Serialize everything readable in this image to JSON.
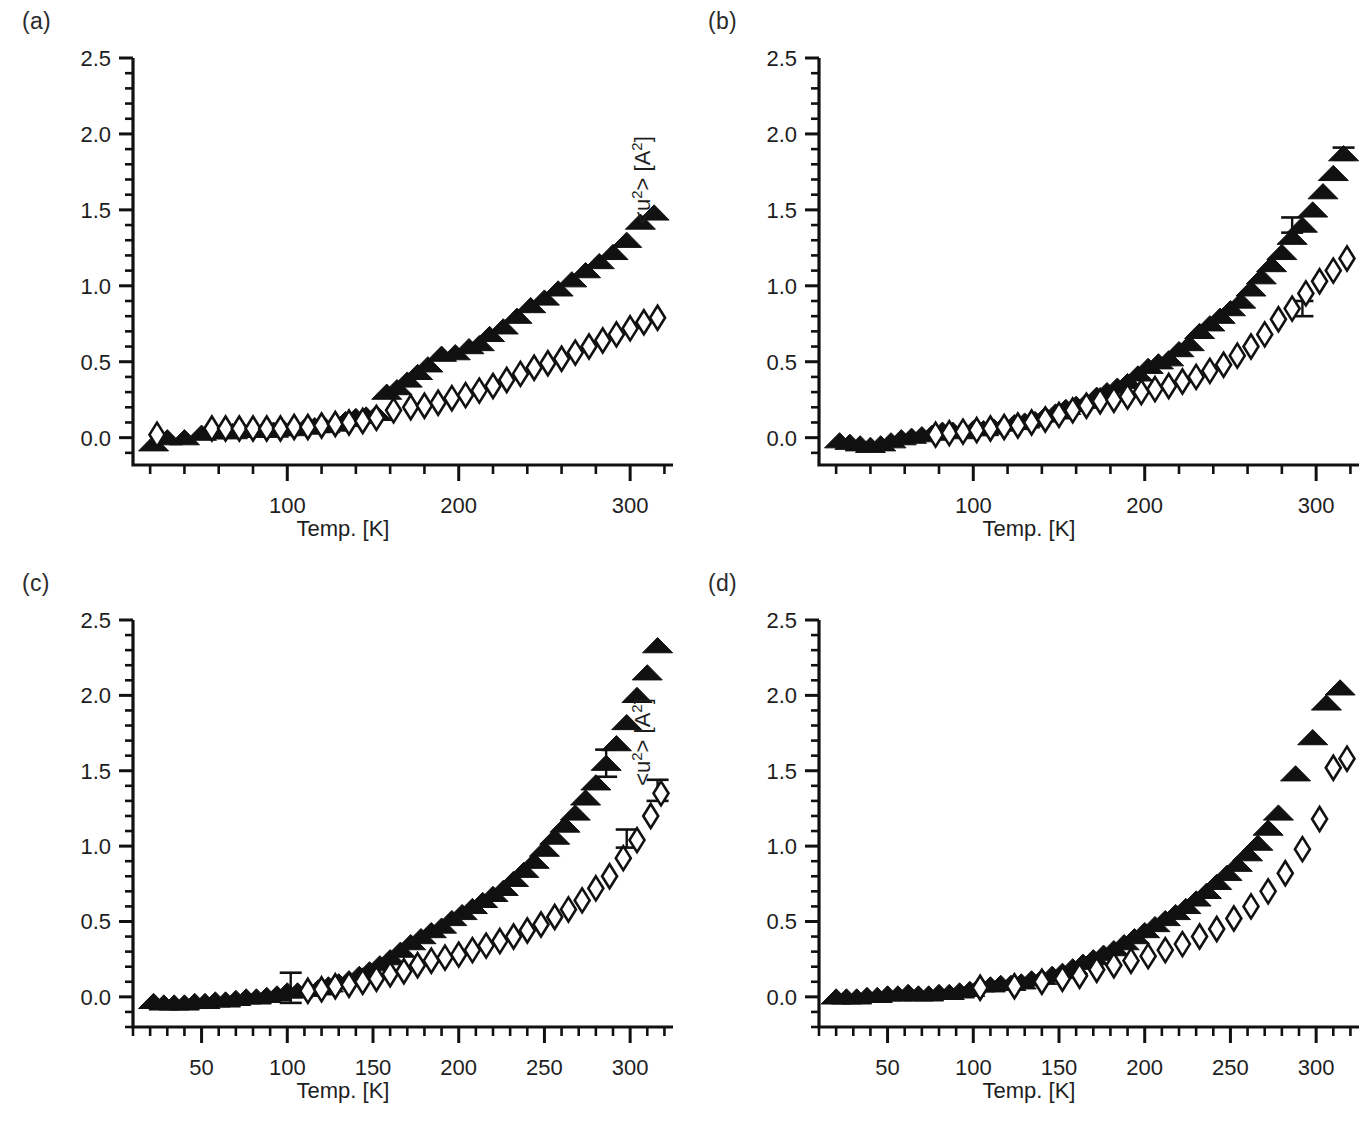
{
  "figure": {
    "background": "#ffffff",
    "panel_count": 4,
    "marker_color": "#111111"
  },
  "panels": [
    {
      "label": "(a)",
      "xlabel": "Temp. [K]",
      "ylabel_prefix": "<u",
      "ylabel_sup1": "2",
      "ylabel_mid": "> [A",
      "ylabel_sup2": "2",
      "ylabel_suffix": "]"
    },
    {
      "label": "(b)",
      "xlabel": "Temp. [K]",
      "ylabel_prefix": "<u",
      "ylabel_sup1": "2",
      "ylabel_mid": "> [A",
      "ylabel_sup2": "2",
      "ylabel_suffix": "]"
    },
    {
      "label": "(c)",
      "xlabel": "Temp. [K]",
      "ylabel_prefix": "<u",
      "ylabel_sup1": "2",
      "ylabel_mid": "> [A",
      "ylabel_sup2": "2",
      "ylabel_suffix": "]"
    },
    {
      "label": "(d)",
      "xlabel": "Temp. [K]",
      "ylabel_prefix": "<u",
      "ylabel_sup1": "2",
      "ylabel_mid": "> [A",
      "ylabel_sup2": "2",
      "ylabel_suffix": "]"
    }
  ],
  "chart_data": [
    {
      "panel": "(a)",
      "type": "scatter",
      "title": "",
      "xlabel": "Temp. [K]",
      "ylabel": "<u2> [A2]",
      "xlim": [
        10,
        325
      ],
      "ylim": [
        -0.18,
        2.5
      ],
      "xticks": [
        100,
        200,
        300
      ],
      "xtick_labels": [
        "100",
        "200",
        "300"
      ],
      "xminor_step": 20,
      "yticks": [
        0.0,
        0.5,
        1.0,
        1.5,
        2.0,
        2.5
      ],
      "ytick_labels": [
        "0.0",
        "0.5",
        "1.0",
        "1.5",
        "2.0",
        "2.5"
      ],
      "yminor_step": 0.1,
      "grid": false,
      "legend": "none",
      "series": [
        {
          "name": "filled-triangle",
          "marker": "triangle",
          "fill": "solid",
          "x": [
            22,
            30,
            40,
            50,
            56,
            62,
            68,
            74,
            80,
            86,
            92,
            98,
            104,
            110,
            116,
            122,
            128,
            134,
            140,
            146,
            152,
            158,
            164,
            170,
            176,
            182,
            190,
            198,
            206,
            212,
            218,
            226,
            234,
            242,
            250,
            258,
            266,
            274,
            282,
            290,
            298,
            306,
            314
          ],
          "y": [
            -0.04,
            0.0,
            0.0,
            0.03,
            0.04,
            0.04,
            0.04,
            0.05,
            0.05,
            0.05,
            0.05,
            0.06,
            0.06,
            0.07,
            0.08,
            0.08,
            0.09,
            0.12,
            0.14,
            0.15,
            0.16,
            0.3,
            0.33,
            0.38,
            0.43,
            0.48,
            0.55,
            0.56,
            0.6,
            0.62,
            0.68,
            0.73,
            0.8,
            0.87,
            0.92,
            0.98,
            1.04,
            1.1,
            1.16,
            1.22,
            1.3,
            1.42,
            1.48,
            1.55
          ]
        },
        {
          "name": "open-diamond",
          "marker": "diamond",
          "fill": "open",
          "x": [
            24,
            56,
            64,
            72,
            80,
            88,
            96,
            104,
            112,
            120,
            128,
            136,
            144,
            152,
            162,
            172,
            180,
            188,
            196,
            204,
            212,
            220,
            228,
            236,
            244,
            252,
            260,
            268,
            276,
            284,
            292,
            300,
            308,
            316
          ],
          "y": [
            0.02,
            0.06,
            0.06,
            0.06,
            0.06,
            0.06,
            0.06,
            0.07,
            0.07,
            0.08,
            0.09,
            0.1,
            0.11,
            0.13,
            0.18,
            0.2,
            0.21,
            0.23,
            0.26,
            0.28,
            0.31,
            0.34,
            0.38,
            0.42,
            0.46,
            0.49,
            0.52,
            0.56,
            0.6,
            0.64,
            0.68,
            0.72,
            0.76,
            0.79
          ]
        }
      ],
      "errorbars": []
    },
    {
      "panel": "(b)",
      "type": "scatter",
      "title": "",
      "xlabel": "Temp. [K]",
      "ylabel": "<u2> [A2]",
      "xlim": [
        10,
        325
      ],
      "ylim": [
        -0.18,
        2.5
      ],
      "xticks": [
        100,
        200,
        300
      ],
      "xtick_labels": [
        "100",
        "200",
        "300"
      ],
      "xminor_step": 20,
      "yticks": [
        0.0,
        0.5,
        1.0,
        1.5,
        2.0,
        2.5
      ],
      "ytick_labels": [
        "0.0",
        "0.5",
        "1.0",
        "1.5",
        "2.0",
        "2.5"
      ],
      "yminor_step": 0.1,
      "grid": false,
      "legend": "none",
      "series": [
        {
          "name": "filled-triangle",
          "marker": "triangle",
          "fill": "solid",
          "x": [
            22,
            28,
            34,
            40,
            46,
            52,
            58,
            64,
            70,
            76,
            82,
            88,
            94,
            100,
            106,
            112,
            118,
            124,
            130,
            136,
            142,
            148,
            154,
            160,
            166,
            172,
            178,
            184,
            190,
            196,
            202,
            208,
            214,
            220,
            226,
            232,
            238,
            244,
            250,
            256,
            262,
            268,
            274,
            280,
            286,
            292,
            298,
            304,
            310,
            316
          ],
          "y": [
            -0.02,
            -0.03,
            -0.04,
            -0.05,
            -0.04,
            -0.02,
            0.0,
            0.01,
            0.02,
            0.03,
            0.05,
            0.05,
            0.04,
            0.06,
            0.06,
            0.07,
            0.09,
            0.1,
            0.11,
            0.12,
            0.15,
            0.17,
            0.2,
            0.22,
            0.24,
            0.28,
            0.31,
            0.34,
            0.37,
            0.42,
            0.47,
            0.5,
            0.52,
            0.58,
            0.62,
            0.7,
            0.75,
            0.8,
            0.85,
            0.9,
            0.98,
            1.06,
            1.14,
            1.22,
            1.32,
            1.4,
            1.5,
            1.62,
            1.74,
            1.87
          ]
        },
        {
          "name": "open-diamond",
          "marker": "diamond",
          "fill": "open",
          "x": [
            78,
            86,
            94,
            102,
            110,
            118,
            126,
            134,
            142,
            150,
            158,
            166,
            174,
            182,
            190,
            198,
            206,
            214,
            222,
            230,
            238,
            246,
            254,
            262,
            270,
            278,
            286,
            294,
            302,
            310,
            318
          ],
          "y": [
            0.02,
            0.03,
            0.04,
            0.05,
            0.06,
            0.07,
            0.08,
            0.1,
            0.12,
            0.15,
            0.18,
            0.21,
            0.24,
            0.25,
            0.27,
            0.3,
            0.32,
            0.34,
            0.37,
            0.4,
            0.44,
            0.48,
            0.54,
            0.6,
            0.68,
            0.78,
            0.85,
            0.95,
            1.03,
            1.1,
            1.18
          ]
        }
      ],
      "errorbars": [
        {
          "x": 286,
          "y": 1.4,
          "yerr": 0.05
        },
        {
          "x": 316,
          "y": 1.87,
          "yerr": 0.04
        },
        {
          "x": 292,
          "y": 0.85,
          "yerr": 0.05
        }
      ]
    },
    {
      "panel": "(c)",
      "type": "scatter",
      "title": "",
      "xlabel": "Temp. [K]",
      "ylabel": "<u2> [A2]",
      "xlim": [
        10,
        325
      ],
      "ylim": [
        -0.2,
        2.5
      ],
      "xticks": [
        50,
        100,
        150,
        200,
        250,
        300
      ],
      "xtick_labels": [
        "50",
        "100",
        "150",
        "200",
        "250",
        "300"
      ],
      "xminor_step": 10,
      "yticks": [
        0.0,
        0.5,
        1.0,
        1.5,
        2.0,
        2.5
      ],
      "ytick_labels": [
        "0.0",
        "0.5",
        "1.0",
        "1.5",
        "2.0",
        "2.5"
      ],
      "yminor_step": 0.1,
      "grid": false,
      "legend": "none",
      "series": [
        {
          "name": "filled-triangle",
          "marker": "triangle",
          "fill": "solid",
          "x": [
            22,
            28,
            34,
            40,
            46,
            52,
            58,
            64,
            70,
            76,
            82,
            88,
            94,
            100,
            106,
            112,
            118,
            124,
            130,
            136,
            142,
            148,
            154,
            160,
            166,
            172,
            178,
            184,
            190,
            196,
            202,
            208,
            214,
            220,
            226,
            232,
            238,
            244,
            250,
            256,
            262,
            268,
            274,
            280,
            286,
            292,
            298,
            304,
            310,
            316
          ],
          "y": [
            -0.03,
            -0.04,
            -0.04,
            -0.04,
            -0.03,
            -0.03,
            -0.02,
            -0.02,
            -0.01,
            0.0,
            0.0,
            0.01,
            0.02,
            0.04,
            0.04,
            0.05,
            0.06,
            0.08,
            0.1,
            0.12,
            0.15,
            0.18,
            0.22,
            0.26,
            0.31,
            0.36,
            0.4,
            0.44,
            0.47,
            0.52,
            0.56,
            0.6,
            0.64,
            0.68,
            0.72,
            0.78,
            0.84,
            0.9,
            0.98,
            1.06,
            1.14,
            1.22,
            1.32,
            1.42,
            1.55,
            1.68,
            1.82,
            2.0,
            2.15,
            2.33
          ]
        },
        {
          "name": "open-diamond",
          "marker": "diamond",
          "fill": "open",
          "x": [
            112,
            120,
            128,
            136,
            144,
            152,
            160,
            168,
            176,
            184,
            192,
            200,
            208,
            216,
            224,
            232,
            240,
            248,
            256,
            264,
            272,
            280,
            288,
            296,
            304,
            312,
            318
          ],
          "y": [
            0.04,
            0.05,
            0.07,
            0.08,
            0.1,
            0.12,
            0.15,
            0.17,
            0.21,
            0.24,
            0.26,
            0.28,
            0.31,
            0.34,
            0.37,
            0.4,
            0.44,
            0.48,
            0.53,
            0.58,
            0.64,
            0.72,
            0.8,
            0.92,
            1.04,
            1.2,
            1.35
          ]
        }
      ],
      "errorbars": [
        {
          "x": 102,
          "y": 0.06,
          "yerr": 0.1
        },
        {
          "x": 286,
          "y": 1.55,
          "yerr": 0.09
        },
        {
          "x": 298,
          "y": 1.05,
          "yerr": 0.06
        },
        {
          "x": 316,
          "y": 1.37,
          "yerr": 0.07
        }
      ]
    },
    {
      "panel": "(d)",
      "type": "scatter",
      "title": "",
      "xlabel": "Temp. [K]",
      "ylabel": "<u2> [A2]",
      "xlim": [
        10,
        325
      ],
      "ylim": [
        -0.2,
        2.5
      ],
      "xticks": [
        50,
        100,
        150,
        200,
        250,
        300
      ],
      "xtick_labels": [
        "50",
        "100",
        "150",
        "200",
        "250",
        "300"
      ],
      "xminor_step": 10,
      "yticks": [
        0.0,
        0.5,
        1.0,
        1.5,
        2.0,
        2.5
      ],
      "ytick_labels": [
        "0.0",
        "0.5",
        "1.0",
        "1.5",
        "2.0",
        "2.5"
      ],
      "yminor_step": 0.1,
      "grid": false,
      "legend": "none",
      "series": [
        {
          "name": "filled-triangle",
          "marker": "triangle",
          "fill": "solid",
          "x": [
            20,
            26,
            32,
            38,
            44,
            50,
            56,
            62,
            68,
            74,
            80,
            86,
            92,
            98,
            104,
            110,
            116,
            122,
            128,
            134,
            140,
            146,
            152,
            158,
            164,
            170,
            176,
            182,
            188,
            194,
            200,
            206,
            212,
            218,
            224,
            230,
            236,
            242,
            248,
            254,
            260,
            266,
            272,
            278,
            288,
            298,
            306,
            314
          ],
          "y": [
            0.0,
            0.0,
            0.0,
            0.01,
            0.01,
            0.02,
            0.02,
            0.03,
            0.02,
            0.02,
            0.03,
            0.03,
            0.04,
            0.05,
            0.08,
            0.08,
            0.09,
            0.09,
            0.1,
            0.12,
            0.13,
            0.15,
            0.17,
            0.2,
            0.23,
            0.26,
            0.29,
            0.32,
            0.36,
            0.4,
            0.44,
            0.48,
            0.52,
            0.56,
            0.6,
            0.65,
            0.7,
            0.76,
            0.82,
            0.88,
            0.95,
            1.02,
            1.12,
            1.22,
            1.48,
            1.72,
            1.95,
            2.05,
            2.35
          ]
        },
        {
          "name": "open-diamond",
          "marker": "diamond",
          "fill": "open",
          "x": [
            104,
            124,
            140,
            152,
            162,
            172,
            182,
            192,
            202,
            212,
            222,
            232,
            242,
            252,
            262,
            272,
            282,
            292,
            302,
            310,
            318
          ],
          "y": [
            0.06,
            0.07,
            0.1,
            0.12,
            0.14,
            0.18,
            0.21,
            0.24,
            0.27,
            0.31,
            0.35,
            0.4,
            0.45,
            0.52,
            0.6,
            0.7,
            0.82,
            0.98,
            1.18,
            1.52,
            1.58
          ]
        }
      ],
      "errorbars": []
    }
  ]
}
